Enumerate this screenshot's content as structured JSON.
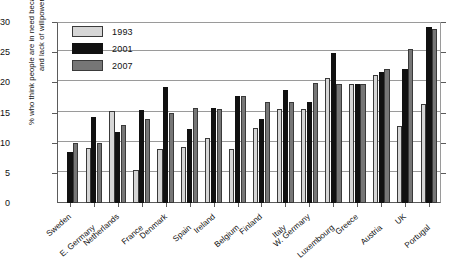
{
  "chart_data": {
    "type": "bar",
    "title": "",
    "subtitle": "",
    "xlabel": "",
    "ylabel": "% who think people are in need because of laziness and lack of willpower",
    "ylim": [
      0,
      30
    ],
    "yticks": [
      0,
      5,
      10,
      15,
      20,
      25,
      30
    ],
    "ytick_labels": [
      "0",
      "5",
      "10",
      "15",
      "20",
      "25",
      "30"
    ],
    "grid": true,
    "legend_position": "top-left",
    "categories": [
      "Sweden",
      "E. Germany",
      "Netherlands",
      "France",
      "Denmark",
      "Spain",
      "Ireland",
      "Belgium",
      "Finland",
      "Italy",
      "W. Germany",
      "Luxembourg",
      "Greece",
      "Austria",
      "UK",
      "Portugal"
    ],
    "series": [
      {
        "name": "1993",
        "color": "#d6d6d6",
        "values": [
          null,
          9.2,
          15.2,
          5.5,
          9.0,
          9.3,
          10.7,
          9.0,
          12.5,
          15.5,
          15.5,
          20.8,
          19.8,
          21.2,
          12.8,
          16.4
        ]
      },
      {
        "name": "2001",
        "color": "#111111",
        "values": [
          8.5,
          14.3,
          11.7,
          15.4,
          19.2,
          12.2,
          15.7,
          17.8,
          14.0,
          18.7,
          16.7,
          24.8,
          19.8,
          21.7,
          22.2,
          29.1
        ]
      },
      {
        "name": "2007",
        "color": "#767676",
        "values": [
          9.9,
          9.9,
          13.0,
          14.0,
          15.0,
          15.7,
          15.5,
          17.8,
          16.7,
          16.7,
          19.9,
          19.8,
          19.8,
          22.2,
          25.6,
          28.8
        ]
      }
    ],
    "legend": [
      {
        "label": "1993",
        "color": "#d6d6d6"
      },
      {
        "label": "2001",
        "color": "#111111"
      },
      {
        "label": "2007",
        "color": "#767676"
      }
    ]
  }
}
